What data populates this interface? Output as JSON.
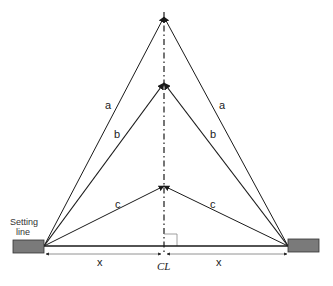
{
  "diagram": {
    "title": "",
    "setting_line_label": [
      "Setting",
      "line"
    ],
    "centerline_label": "CL",
    "dimension_labels": {
      "left": "x",
      "right": "x"
    },
    "line_labels": {
      "a_left": "a",
      "a_right": "a",
      "b_left": "b",
      "b_right": "b",
      "c_left": "c",
      "c_right": "c"
    },
    "colors": {
      "line": "#1a1a1a",
      "box_fill": "#7a7a7a",
      "box_stroke": "#333333",
      "dim_line": "#555555"
    },
    "points": {
      "left_base": [
        44,
        246
      ],
      "right_base": [
        288,
        246
      ],
      "apex_a": [
        164,
        17
      ],
      "apex_b": [
        164,
        83
      ],
      "apex_c": [
        164,
        186
      ],
      "centerline_base": [
        164,
        246
      ]
    }
  }
}
